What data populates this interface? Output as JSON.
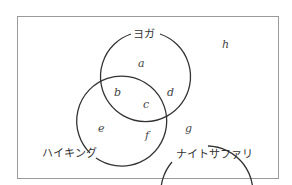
{
  "diagram": {
    "type": "venn",
    "sets": [
      {
        "name": "ヨガ"
      },
      {
        "name": "ハイキング"
      },
      {
        "name": "ナイトサファリ"
      }
    ],
    "regions": {
      "a": "a",
      "b": "b",
      "c": "c",
      "d": "d",
      "e": "e",
      "f": "f",
      "g": "g",
      "h": "h"
    },
    "region_meaning": {
      "a": "ヨガ only",
      "b": "ヨガ ∩ ハイキング only",
      "c": "ヨガ ∩ ハイキング ∩ ナイトサファリ",
      "d": "ヨガ ∩ ナイトサファリ only",
      "e": "ハイキング only",
      "f": "ハイキング ∩ ナイトサファリ only",
      "g": "ナイトサファリ only",
      "h": "none"
    }
  }
}
